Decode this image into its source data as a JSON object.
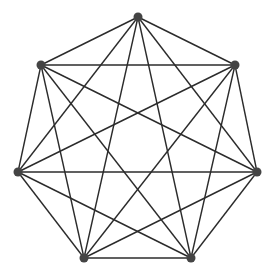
{
  "diagram": {
    "type": "complete-graph",
    "name": "K7",
    "vertex_color": "#444444",
    "edge_color": "#2b2b2b",
    "vertices": [
      {
        "id": "v1",
        "x": 138,
        "y": 17
      },
      {
        "id": "v2",
        "x": 235,
        "y": 65
      },
      {
        "id": "v3",
        "x": 257,
        "y": 172
      },
      {
        "id": "v4",
        "x": 191,
        "y": 258
      },
      {
        "id": "v5",
        "x": 84,
        "y": 258
      },
      {
        "id": "v6",
        "x": 18,
        "y": 172
      },
      {
        "id": "v7",
        "x": 41,
        "y": 65
      }
    ]
  }
}
